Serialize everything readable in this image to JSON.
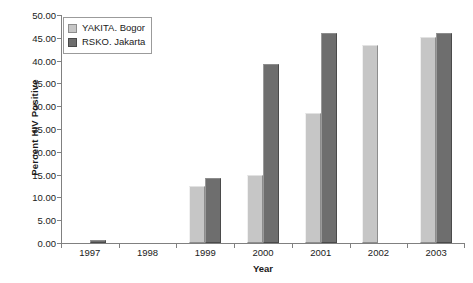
{
  "chart_data": {
    "type": "bar",
    "title": "",
    "xlabel": "Year",
    "ylabel": "Percent HIV Positive",
    "categories": [
      "1997",
      "1998",
      "1999",
      "2000",
      "2001",
      "2002",
      "2003"
    ],
    "series": [
      {
        "name": "YAKITA. Bogor",
        "color": "#c6c6c6",
        "values": [
          null,
          null,
          12.5,
          14.9,
          28.5,
          43.4,
          45.1
        ]
      },
      {
        "name": "RSKO. Jakarta",
        "color": "#6e6e6e",
        "values": [
          0.7,
          null,
          14.3,
          39.2,
          46.0,
          null,
          46.1
        ]
      }
    ],
    "ylim": [
      0,
      50
    ],
    "ytick_step": 5,
    "ytick_labels": [
      "0.00",
      "5.00",
      "10.00",
      "15.00",
      "20.00",
      "25.00",
      "30.00",
      "35.00",
      "40.00",
      "45.00",
      "50.00"
    ],
    "grid": false,
    "legend_position": "top-left",
    "axis_color": "#808080"
  },
  "legend": {
    "items": [
      {
        "label": "YAKITA. Bogor"
      },
      {
        "label": "RSKO. Jakarta"
      }
    ]
  },
  "axes": {
    "x_title": "Year",
    "y_title": "Percent HIV Positive"
  }
}
